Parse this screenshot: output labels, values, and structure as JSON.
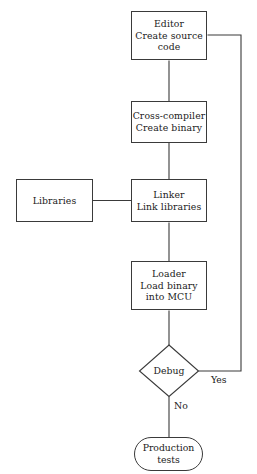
{
  "diagram": {
    "background_color": "#ffffff",
    "line_color": "#3a3a3a",
    "text_color": "#1a1a1a",
    "nodes": {
      "editor": {
        "label": "Editor\nCreate source\ncode",
        "shape": "rectangle"
      },
      "cross_compiler": {
        "label": "Cross-compiler\nCreate binary",
        "shape": "rectangle"
      },
      "libraries": {
        "label": "Libraries",
        "shape": "rectangle"
      },
      "linker": {
        "label": "Linker\nLink libraries",
        "shape": "rectangle"
      },
      "loader": {
        "label": "Loader\nLoad binary\ninto MCU",
        "shape": "rectangle"
      },
      "debug": {
        "label": "Debug",
        "shape": "diamond"
      },
      "production_tests": {
        "label": "Production\ntests",
        "shape": "stadium"
      }
    },
    "edge_labels": {
      "yes": "Yes",
      "no": "No"
    }
  }
}
